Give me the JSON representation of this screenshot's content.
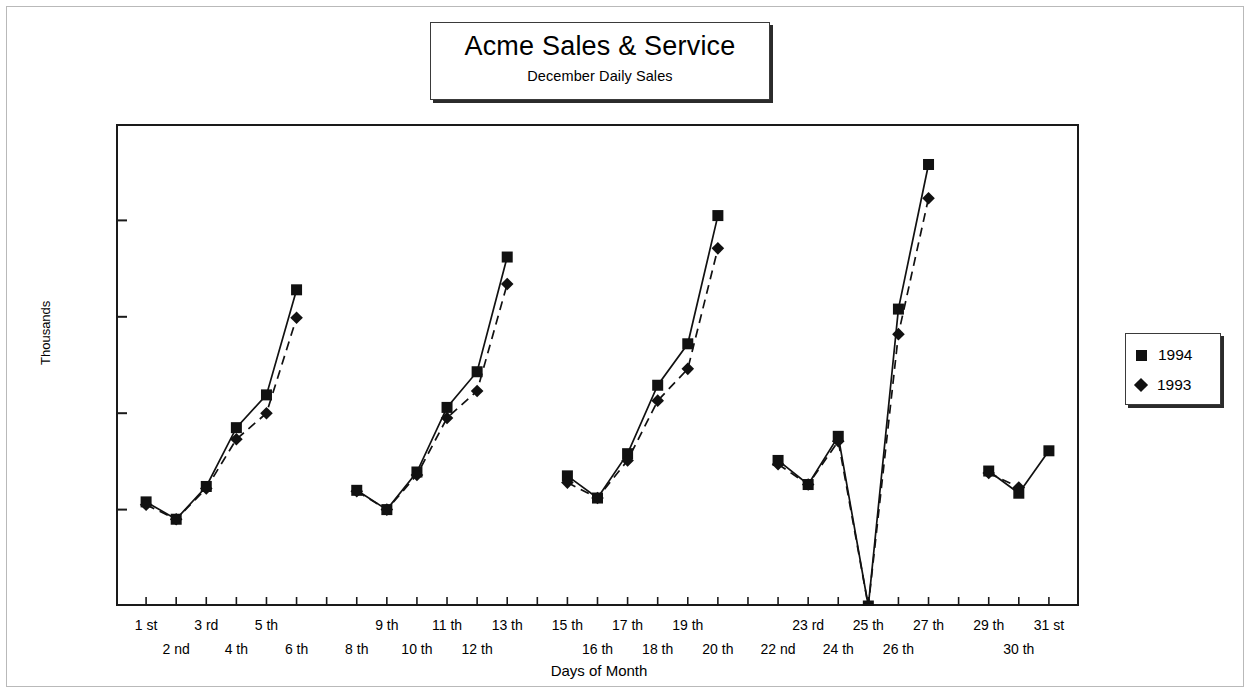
{
  "title": {
    "main": "Acme Sales & Service",
    "sub": "December Daily Sales"
  },
  "axes": {
    "ylabel": "Thousands",
    "xlabel": "Days of Month"
  },
  "legend": {
    "items": [
      {
        "label": "1994",
        "marker": "square-marker-icon",
        "color": "#111111",
        "line": "solid"
      },
      {
        "label": "1993",
        "marker": "diamond-marker-icon",
        "color": "#111111",
        "line": "dashed"
      }
    ]
  },
  "chart_data": {
    "type": "line",
    "title": "Acme Sales & Service",
    "subtitle": "December Daily Sales",
    "xlabel": "Days of Month",
    "ylabel": "Thousands",
    "ylim": [
      0,
      500
    ],
    "yticks": [
      0,
      100,
      200,
      300,
      400,
      500
    ],
    "grid": false,
    "legend_position": "right",
    "categories": [
      "1 st",
      "2 nd",
      "3 rd",
      "4 th",
      "5 th",
      "6 th",
      "",
      "8 th",
      "9 th",
      "10 th",
      "11 th",
      "12 th",
      "13 th",
      "",
      "15 th",
      "16 th",
      "17 th",
      "18 th",
      "19 th",
      "20 th",
      "",
      "22 nd",
      "23 rd",
      "24 th",
      "25 th",
      "26 th",
      "27 th",
      "",
      "29 th",
      "30 th",
      "31 st"
    ],
    "series": [
      {
        "name": "1994",
        "marker": "square",
        "line": "solid",
        "values": [
          108,
          90,
          124,
          185,
          219,
          328,
          null,
          120,
          100,
          139,
          206,
          243,
          362,
          null,
          135,
          112,
          158,
          229,
          272,
          405,
          null,
          151,
          126,
          176,
          0,
          308,
          458,
          null,
          140,
          117,
          161
        ]
      },
      {
        "name": "1993",
        "marker": "diamond",
        "line": "dashed",
        "values": [
          105,
          90,
          122,
          173,
          200,
          299,
          null,
          119,
          100,
          136,
          195,
          223,
          334,
          null,
          128,
          112,
          151,
          213,
          246,
          371,
          null,
          147,
          126,
          171,
          0,
          282,
          423,
          null,
          138,
          123,
          null
        ]
      }
    ]
  }
}
